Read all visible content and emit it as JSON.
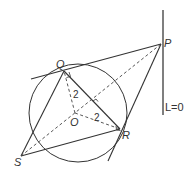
{
  "diagram": {
    "type": "geometry",
    "points": {
      "P": {
        "label": "P",
        "x": 161,
        "y": 44
      },
      "Q": {
        "label": "Q",
        "x": 64,
        "y": 71
      },
      "R": {
        "label": "R",
        "x": 120,
        "y": 129
      },
      "O": {
        "label": "O",
        "x": 75,
        "y": 113
      },
      "S": {
        "label": "S",
        "x": 21,
        "y": 156
      }
    },
    "circle": {
      "cx": 78,
      "cy": 113,
      "r": 49
    },
    "line_L": {
      "label": "L=0",
      "x": 163,
      "y1": 10,
      "y2": 115
    },
    "radius_labels": [
      {
        "text": "2",
        "x": 73,
        "y": 97
      },
      {
        "text": "2",
        "x": 94,
        "y": 119
      }
    ],
    "colors": {
      "stroke": "#333333",
      "background": "#ffffff"
    }
  }
}
